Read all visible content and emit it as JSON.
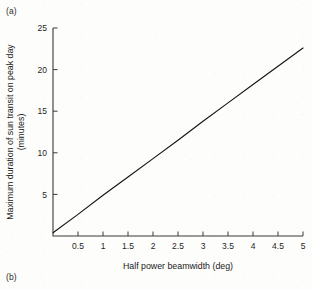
{
  "figure": {
    "panel_a_label": "(a)",
    "panel_b_label": "(b)"
  },
  "chart_data": {
    "type": "line",
    "title": "",
    "xlabel": "Half power beamwidth (deg)",
    "ylabel": "Maximum duration of sun transit on peak day",
    "ylabel_line2": "(minutes)",
    "xlim": [
      0,
      5
    ],
    "ylim": [
      0,
      25
    ],
    "grid": false,
    "legend": false,
    "xticks": [
      0.5,
      1,
      1.5,
      2,
      2.5,
      3,
      3.5,
      4,
      4.5,
      5
    ],
    "xticklabels": [
      "0.5",
      "1",
      "1.5",
      "2",
      "2.5",
      "3",
      "3.5",
      "4",
      "4.5",
      "5"
    ],
    "yticks": [
      5,
      10,
      15,
      20,
      25
    ],
    "yticklabels": [
      "5",
      "10",
      "15",
      "20",
      "25"
    ],
    "series": [
      {
        "name": "Maximum sun transit duration",
        "x": [
          0,
          0.5,
          1,
          1.5,
          2,
          2.5,
          3,
          3.5,
          4,
          4.5,
          5
        ],
        "values": [
          0.4,
          2.6,
          4.9,
          7.1,
          9.3,
          11.5,
          13.8,
          16.0,
          18.2,
          20.4,
          22.6
        ],
        "color": "#151515"
      }
    ],
    "annotations": []
  },
  "colors": {
    "axis": "#3a3a3a",
    "line": "#151515",
    "text": "#1a1a1a",
    "background": "#fdfdfc"
  }
}
